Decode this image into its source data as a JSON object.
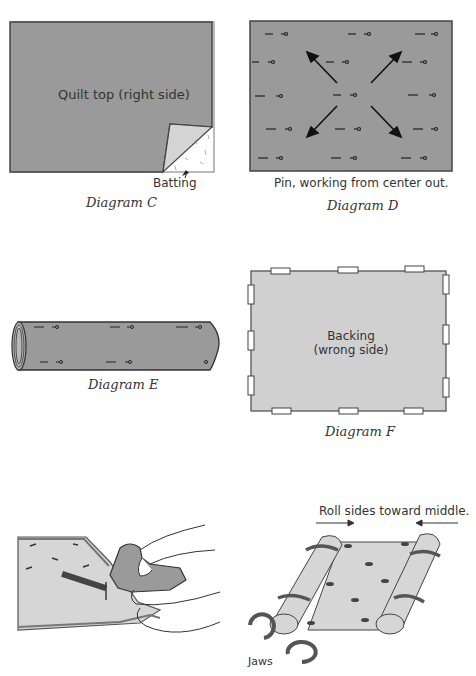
{
  "diagram_c": {
    "label": "Quilt top (right side)",
    "batting_label": "Batting",
    "caption": "Diagram C"
  },
  "diagram_d": {
    "note": "Pin, working from center out.",
    "caption": "Diagram D"
  },
  "diagram_e": {
    "caption": "Diagram E"
  },
  "diagram_f": {
    "label_line1": "Backing",
    "label_line2": "(wrong side)",
    "caption": "Diagram F"
  },
  "illustration_roll": {
    "note": "Roll sides toward middle.",
    "jaws_label": "Jaws"
  },
  "colors": {
    "fabric_dark": "#9a9a9a",
    "fabric_light": "#d0d0d0",
    "outline": "#444444",
    "text": "#333333"
  }
}
